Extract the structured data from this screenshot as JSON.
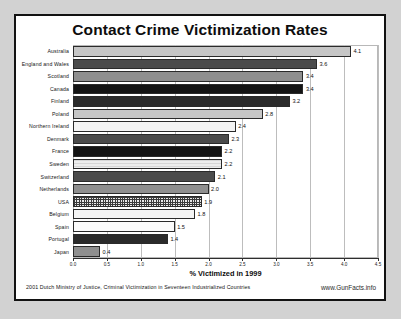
{
  "chart_data": {
    "type": "bar",
    "orientation": "horizontal",
    "title": "Contact Crime Victimization Rates",
    "xlabel": "% Victimized in 1999",
    "ylabel": "",
    "xlim": [
      0,
      4.5
    ],
    "xticks": [
      "0.0",
      "0.5",
      "1.0",
      "1.5",
      "2.0",
      "2.5",
      "3.0",
      "3.5",
      "4.0",
      "4.5"
    ],
    "grid": true,
    "legend": "none",
    "categories": [
      "Australia",
      "England and Wales",
      "Scotland",
      "Canada",
      "Finland",
      "Poland",
      "Northern Ireland",
      "Denmark",
      "France",
      "Sweden",
      "Switzerland",
      "Netherlands",
      "USA",
      "Belgium",
      "Spain",
      "Portugal",
      "Japan"
    ],
    "values": [
      4.1,
      3.6,
      3.4,
      3.4,
      3.2,
      2.8,
      2.4,
      2.3,
      2.2,
      2.2,
      2.1,
      2.0,
      1.9,
      1.8,
      1.5,
      1.4,
      0.4
    ],
    "value_labels": [
      "4.1",
      "3.6",
      "3.4",
      "3.4",
      "3.2",
      "2.8",
      "2.4",
      "2.3",
      "2.2",
      "2.2",
      "2.1",
      "2.0",
      "1.9",
      "1.8",
      "1.5",
      "1.4",
      "0.4"
    ],
    "bar_fills": [
      "f-lightgray",
      "f-darkgray",
      "f-midgray",
      "f-black",
      "f-vdark",
      "f-lightgray",
      "f-offwhite",
      "f-darkgray",
      "f-black",
      "f-paleline",
      "f-darkgray",
      "f-midgray",
      "f-grid",
      "f-offwhite",
      "f-white",
      "f-vdark",
      "f-midgray"
    ]
  },
  "footer": {
    "source": "2001 Dutch Ministry of Justice, Criminal Victimization in Seventeen Industrialized Countries",
    "credit": "www.GunFacts.info"
  }
}
